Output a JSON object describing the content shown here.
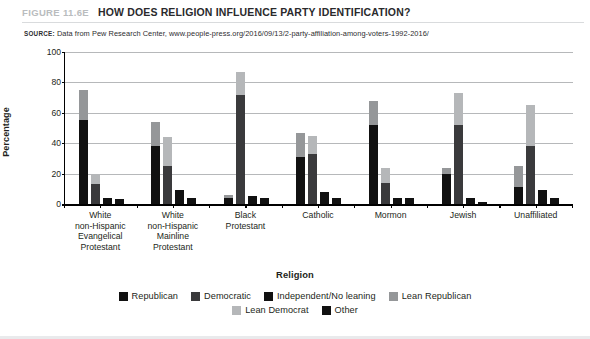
{
  "header": {
    "figure_number": "FIGURE 11.6E",
    "title": "HOW DOES RELIGION INFLUENCE PARTY IDENTIFICATION?",
    "source_label": "SOURCE:",
    "source_text": "Data from Pew Research Center, www.people-press.org/2016/09/13/2-party-affiliation-among-voters-1992-2016/"
  },
  "chart_data": {
    "type": "bar",
    "title": "HOW DOES RELIGION INFLUENCE PARTY IDENTIFICATION?",
    "xlabel": "Religion",
    "ylabel": "Percentage",
    "ylim": [
      0,
      100
    ],
    "yticks": [
      0,
      20,
      40,
      60,
      80,
      100
    ],
    "grid": true,
    "legend_position": "bottom",
    "stacked_groups": true,
    "categories": [
      "White\nnon-Hispanic\nEvangelical\nProtestant",
      "White\nnon-Hispanic\nMainline\nProtestant",
      "Black\nProtestant",
      "Catholic",
      "Mormon",
      "Jewish",
      "Unaffiliated"
    ],
    "series": [
      {
        "name": "Republican",
        "color": "#111111",
        "values": [
          55,
          38,
          4,
          31,
          52,
          20,
          11
        ]
      },
      {
        "name": "Lean Republican",
        "color": "#959799",
        "values": [
          20,
          16,
          2,
          16,
          16,
          4,
          14
        ]
      },
      {
        "name": "Democratic",
        "color": "#3a3a3c",
        "values": [
          13,
          25,
          72,
          33,
          14,
          52,
          38
        ]
      },
      {
        "name": "Lean Democrat",
        "color": "#b5b7b9",
        "values": [
          7,
          19,
          15,
          12,
          10,
          21,
          27
        ]
      },
      {
        "name": "Independent/No leaning",
        "color": "#111111",
        "values": [
          4,
          9,
          5,
          8,
          4,
          4,
          9
        ]
      },
      {
        "name": "Other",
        "color": "#111111",
        "values": [
          3,
          4,
          4,
          4,
          4,
          1,
          4
        ]
      }
    ],
    "bar_stacks": [
      {
        "name": "Republican stack",
        "parts": [
          "Republican",
          "Lean Republican"
        ]
      },
      {
        "name": "Democratic stack",
        "parts": [
          "Democratic",
          "Lean Democrat"
        ]
      },
      {
        "name": "Independent/No leaning",
        "parts": [
          "Independent/No leaning"
        ]
      },
      {
        "name": "Other",
        "parts": [
          "Other"
        ]
      }
    ]
  },
  "legend": {
    "row1": [
      {
        "label": "Republican",
        "color": "#111111"
      },
      {
        "label": "Democratic",
        "color": "#3a3a3c"
      },
      {
        "label": "Independent/No leaning",
        "color": "#111111"
      },
      {
        "label": "Lean Republican",
        "color": "#959799"
      }
    ],
    "row2": [
      {
        "label": "Lean Democrat",
        "color": "#b5b7b9"
      },
      {
        "label": "Other",
        "color": "#111111"
      }
    ]
  }
}
